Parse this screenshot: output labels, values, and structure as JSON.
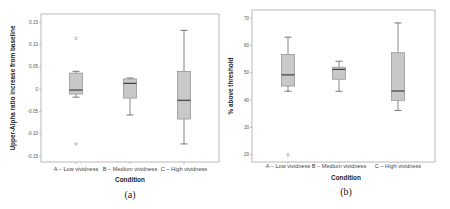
{
  "chart_data": [
    {
      "type": "boxplot",
      "caption": "(a)",
      "xlabel": "Condition",
      "ylabel": "Upper-Alpha ratio increase from baseline",
      "ylim": [
        -0.16,
        0.17
      ],
      "yticks": [
        0.15,
        0.1,
        0.05,
        0,
        -0.05,
        -0.1,
        -0.15
      ],
      "ytick_labels": [
        "0.15",
        "0.10",
        "0.05",
        "0",
        "-0.05",
        "-0.10",
        "-0.15"
      ],
      "grid": false,
      "categories": [
        "A – Low vividness",
        "B – Medium vividness",
        "C – High vividness"
      ],
      "boxes": [
        {
          "category": "A – Low vividness",
          "whisker_low": -0.018,
          "q1": -0.011,
          "median": -0.002,
          "q3": 0.036,
          "whisker_high": 0.04,
          "outliers": [
            0.114,
            -0.123
          ]
        },
        {
          "category": "B – Medium vividness",
          "whisker_low": -0.058,
          "q1": -0.02,
          "median": 0.013,
          "q3": 0.023,
          "whisker_high": 0.025,
          "outliers": []
        },
        {
          "category": "C – High vividness",
          "whisker_low": -0.123,
          "q1": -0.067,
          "median": -0.025,
          "q3": 0.04,
          "whisker_high": 0.132,
          "outliers": []
        }
      ]
    },
    {
      "type": "boxplot",
      "caption": "(b)",
      "xlabel": "Condition",
      "ylabel": "% above threshold",
      "ylim": [
        18,
        73
      ],
      "yticks": [
        70,
        60,
        50,
        40,
        30,
        20
      ],
      "ytick_labels": [
        "70",
        "60",
        "50",
        "40",
        "30",
        "20"
      ],
      "grid": false,
      "categories": [
        "A – Low vividness",
        "B – Medium vividness",
        "C – High vividness"
      ],
      "boxes": [
        {
          "category": "A – Low vividness",
          "whisker_low": 43.2,
          "q1": 45.1,
          "median": 49.2,
          "q3": 56.6,
          "whisker_high": 63.0,
          "outliers": [
            20.0
          ]
        },
        {
          "category": "B – Medium vividness",
          "whisker_low": 43.2,
          "q1": 47.6,
          "median": 51.2,
          "q3": 52.0,
          "whisker_high": 54.2,
          "outliers": []
        },
        {
          "category": "C – High vividness",
          "whisker_low": 36.2,
          "q1": 39.9,
          "median": 43.3,
          "q3": 57.3,
          "whisker_high": 68.2,
          "outliers": []
        }
      ]
    }
  ],
  "style": {
    "box_fill": "#c8c8c8",
    "box_stroke": "#8c8c8c",
    "median_color": "#333333",
    "whisker_color": "#555555",
    "frame_color": "#9a9a9a"
  }
}
